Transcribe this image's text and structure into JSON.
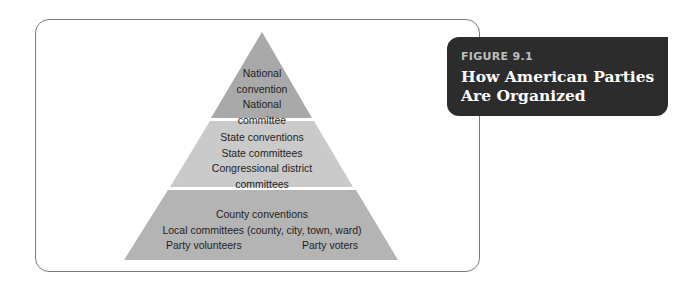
{
  "figure": {
    "number": "FIGURE 9.1",
    "title_lines": [
      "How American Parties",
      "Are Organized"
    ]
  },
  "pyramid": {
    "tiers": [
      {
        "level": "national",
        "lines": [
          "National",
          "convention",
          "National",
          "committee"
        ],
        "color": "#a9a9a9"
      },
      {
        "level": "state",
        "lines": [
          "State conventions",
          "State committees",
          "Congressional district",
          "committees"
        ],
        "color": "#cacaca"
      },
      {
        "level": "local",
        "lines": [
          "County conventions",
          "Local committees (county, city, town, ward)"
        ],
        "bottom_row": [
          "Party volunteers",
          "Party voters"
        ],
        "color": "#b4b4b4"
      }
    ]
  },
  "colors": {
    "figure_box": "#2c2c2c",
    "frame_border": "#7a7a7a",
    "text": "#1e1e1e"
  }
}
